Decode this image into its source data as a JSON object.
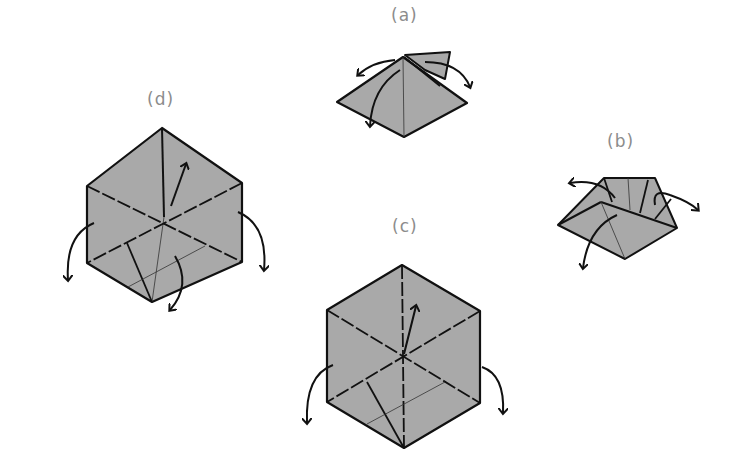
{
  "figure": {
    "paper_color": "#a9a9a9",
    "line_color": "#111111",
    "label_color": "#8c8c8c"
  },
  "steps": [
    {
      "id": "a",
      "label": "(a)",
      "shape": "pyramid"
    },
    {
      "id": "b",
      "label": "(b)",
      "shape": "open-box"
    },
    {
      "id": "c",
      "label": "(c)",
      "shape": "hexagon"
    },
    {
      "id": "d",
      "label": "(d)",
      "shape": "hexagon"
    }
  ]
}
